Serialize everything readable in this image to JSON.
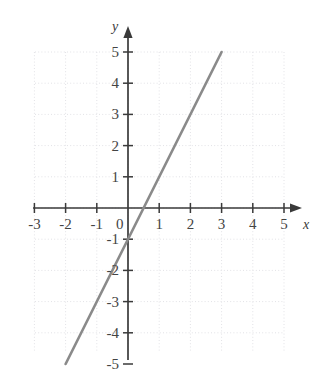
{
  "chart_data": {
    "type": "line",
    "title": "",
    "subtitle": "",
    "xlabel": "x",
    "ylabel": "y",
    "xlim": [
      -3.4,
      5.6
    ],
    "ylim": [
      -5.6,
      5.7
    ],
    "grid": true,
    "grid_style": "dotted",
    "legend": "none",
    "equation": "y = 2x - 1",
    "x_ticks": [
      -3,
      -2,
      -1,
      0,
      1,
      2,
      3,
      4,
      5
    ],
    "x_tick_labels": [
      "-3",
      "-2",
      "-1",
      "0",
      "1",
      "2",
      "3",
      "4",
      "5"
    ],
    "y_ticks": [
      -5,
      -4,
      -3,
      -2,
      -1,
      1,
      2,
      3,
      4,
      5
    ],
    "y_tick_labels": [
      "-5",
      "-4",
      "-3",
      "-2",
      "-1",
      "1",
      "2",
      "3",
      "4",
      "5"
    ],
    "origin_label": "0",
    "series": [
      {
        "name": "line",
        "color": "#8a8a8a",
        "width": 2.6,
        "points": [
          {
            "x": -2.0,
            "y": -5.0
          },
          {
            "x": 3.0,
            "y": 5.0
          }
        ],
        "x_intercept": 0.5,
        "y_intercept": -1.0,
        "slope": 2.0
      }
    ],
    "axis_color": "#3a3a3a",
    "grid_color": "#e2e2e6",
    "tick_label_color": "#444444",
    "background_color": "#ffffff"
  },
  "geometry": {
    "origin_px": {
      "x": 128,
      "y": 208
    },
    "unit_px": 31.2,
    "x_axis_start_px": 33,
    "x_axis_end_px": 300,
    "y_axis_top_px": 28,
    "y_axis_bottom_px": 360,
    "grid_left_px": 35,
    "grid_right_px": 284,
    "grid_top_px": 52,
    "grid_bottom_px": 352
  },
  "labels": {
    "x_axis_name": "x",
    "y_axis_name": "y"
  }
}
